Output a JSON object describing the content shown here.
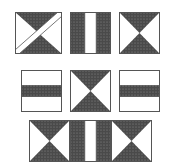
{
  "colors": {
    "dark": "#4a4a4a",
    "dot": "#7a7a7a",
    "light": "#ffffff",
    "stroke": "#555555"
  },
  "tiles": [
    {
      "id": "r1c1",
      "pattern": "hourglass-diagonal",
      "x": 15,
      "y": 12,
      "w": 47,
      "h": 42
    },
    {
      "id": "r1c2",
      "pattern": "vertical-stripes",
      "x": 70,
      "y": 12,
      "w": 41,
      "h": 42
    },
    {
      "id": "r1c3",
      "pattern": "hourglass",
      "x": 119,
      "y": 12,
      "w": 41,
      "h": 42
    },
    {
      "id": "r2c1",
      "pattern": "horizontal-band",
      "x": 21,
      "y": 70,
      "w": 41,
      "h": 42
    },
    {
      "id": "r2c2",
      "pattern": "hourglass",
      "x": 70,
      "y": 70,
      "w": 41,
      "h": 42
    },
    {
      "id": "r2c3",
      "pattern": "horizontal-band",
      "x": 119,
      "y": 70,
      "w": 41,
      "h": 42
    },
    {
      "id": "r3c1",
      "pattern": "hourglass",
      "x": 29,
      "y": 120,
      "w": 41,
      "h": 42
    },
    {
      "id": "r3c2",
      "pattern": "vertical-stripes",
      "x": 70,
      "y": 120,
      "w": 41,
      "h": 42
    },
    {
      "id": "r3c3",
      "pattern": "hourglass",
      "x": 111,
      "y": 120,
      "w": 41,
      "h": 42
    }
  ]
}
